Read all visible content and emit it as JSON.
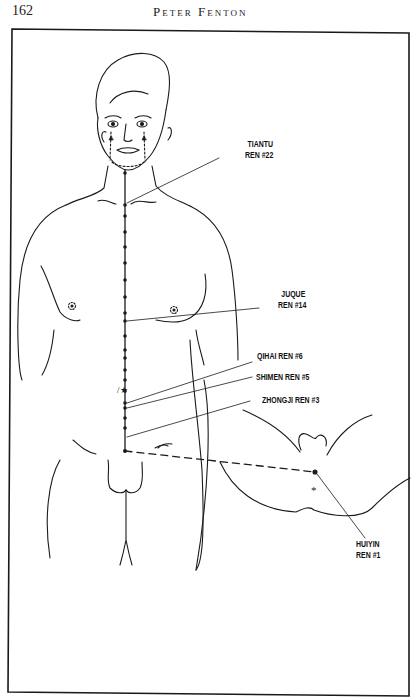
{
  "header": {
    "page_number": "162",
    "running_head": "Peter Fenton"
  },
  "figure": {
    "labels": [
      {
        "id": "tiantu",
        "line1": "TIANTU",
        "line2": "REN #22"
      },
      {
        "id": "juque",
        "line1": "JUQUE",
        "line2": "REN #14"
      },
      {
        "id": "qihai",
        "line1": "QIHAI  REN #6"
      },
      {
        "id": "shimen",
        "line1": "SHIMEN  REN #5"
      },
      {
        "id": "zhongji",
        "line1": "ZHONGJI  REN #3"
      },
      {
        "id": "huiyin",
        "line1": "HUIYIN",
        "line2": "REN #1"
      }
    ],
    "stroke_color": "#1a1a1a"
  }
}
